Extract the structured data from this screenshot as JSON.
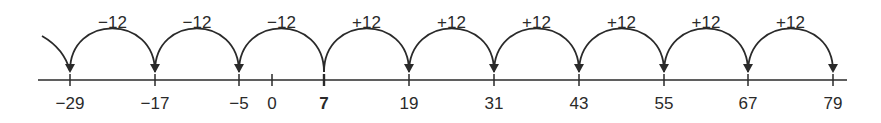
{
  "diagram": {
    "type": "number-line",
    "start_value": 7,
    "step": 12,
    "ticks": [
      {
        "value": -29,
        "label": "−29",
        "x": 70
      },
      {
        "value": -17,
        "label": "−17",
        "x": 155
      },
      {
        "value": -5,
        "label": "−5",
        "x": 239
      },
      {
        "value": 0,
        "label": "0",
        "x": 272
      },
      {
        "value": 7,
        "label": "7",
        "x": 324,
        "bold": true
      },
      {
        "value": 19,
        "label": "19",
        "x": 409
      },
      {
        "value": 31,
        "label": "31",
        "x": 494
      },
      {
        "value": 43,
        "label": "43",
        "x": 579
      },
      {
        "value": 55,
        "label": "55",
        "x": 664
      },
      {
        "value": 67,
        "label": "67",
        "x": 748
      },
      {
        "value": 79,
        "label": "79",
        "x": 833
      }
    ],
    "jumps": [
      {
        "label": "−12",
        "from": -5,
        "to": -17
      },
      {
        "label": "−12",
        "from": 7,
        "to": -5
      },
      {
        "label": "−12",
        "from": -17,
        "to": -29
      },
      {
        "label": "+12",
        "from": 7,
        "to": 19
      },
      {
        "label": "+12",
        "from": 19,
        "to": 31
      },
      {
        "label": "+12",
        "from": 31,
        "to": 43
      },
      {
        "label": "+12",
        "from": 43,
        "to": 55
      },
      {
        "label": "+12",
        "from": 55,
        "to": 67
      },
      {
        "label": "+12",
        "from": 67,
        "to": 79
      }
    ],
    "color": "#2a2a2a"
  }
}
